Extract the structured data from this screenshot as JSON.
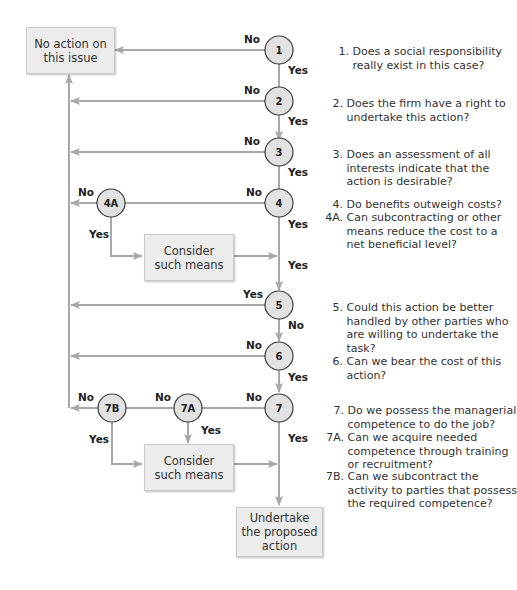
{
  "colors": {
    "line": "#a8a8a8",
    "node_fill": "#e2e2e2",
    "node_stroke": "#3a3a3a",
    "box_fill": "#ececec"
  },
  "boxes": {
    "no_action": "No action on\nthis issue",
    "consider_1": "Consider\nsuch means",
    "consider_2": "Consider\nsuch means",
    "undertake": "Undertake\nthe proposed\naction"
  },
  "nodes": {
    "n1": "1",
    "n2": "2",
    "n3": "3",
    "n4": "4",
    "n4a": "4A",
    "n5": "5",
    "n6": "6",
    "n7": "7",
    "n7a": "7A",
    "n7b": "7B"
  },
  "edge_labels": {
    "n1_no": "No",
    "n1_yes": "Yes",
    "n2_no": "No",
    "n2_yes": "Yes",
    "n3_no": "No",
    "n3_yes": "Yes",
    "n4_no": "No",
    "n4_yes": "Yes",
    "n4a_no": "No",
    "n4a_yes": "Yes",
    "consider1_yes": "Yes",
    "n5_yes": "Yes",
    "n5_no": "No",
    "n6_no": "No",
    "n6_yes": "Yes",
    "n7_no": "No",
    "n7_yes": "Yes",
    "n7a_no": "No",
    "n7a_yes": "Yes",
    "n7b_no": "No",
    "n7b_yes": "Yes"
  },
  "questions": [
    {
      "num": "1.",
      "text": "Does a social responsibility\nreally exist in this case?"
    },
    {
      "num": "2.",
      "text": "Does the firm have a right to\nundertake this action?"
    },
    {
      "num": "3.",
      "text": "Does an assessment of all\ninterests indicate that the\naction is desirable?"
    },
    {
      "num": "4.",
      "text": "Do benefits outweigh costs?"
    },
    {
      "num": "4A.",
      "text": "Can subcontracting or other\nmeans reduce the cost to a\nnet beneficial level?"
    },
    {
      "num": "5.",
      "text": "Could this action be better\nhandled by other parties who\nare willing to undertake the\ntask?"
    },
    {
      "num": "6.",
      "text": "Can we bear the cost of this\naction?"
    },
    {
      "num": "7.",
      "text": "Do we possess the managerial\ncompetence to do the job?"
    },
    {
      "num": "7A.",
      "text": "Can we acquire needed\ncompetence through training\nor recruitment?"
    },
    {
      "num": "7B.",
      "text": "Can we subcontract the\nactivity to parties that possess\nthe required competence?"
    }
  ]
}
